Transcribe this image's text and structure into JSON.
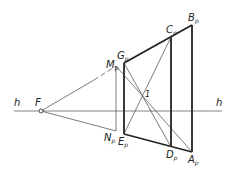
{
  "diagram": {
    "type": "perspective-construction",
    "horizon_label_left": "h",
    "horizon_label_right": "h",
    "vanishing_point": {
      "label": "F",
      "x": 41,
      "y": 111
    },
    "points": {
      "Gp": {
        "main": "G",
        "sub": "p",
        "x": 124,
        "y": 63
      },
      "Ep": {
        "main": "E",
        "sub": "p",
        "x": 124,
        "y": 134
      },
      "Cp": {
        "main": "C",
        "sub": "p",
        "x": 171,
        "y": 37
      },
      "Dp": {
        "main": "D",
        "sub": "p",
        "x": 171,
        "y": 147
      },
      "Bp": {
        "main": "B",
        "sub": "p",
        "x": 192,
        "y": 25
      },
      "Ap": {
        "main": "A",
        "sub": "p",
        "x": 192,
        "y": 152
      },
      "Mp": {
        "main": "M",
        "sub": "p",
        "x": 116,
        "y": 66
      },
      "Np": {
        "main": "N",
        "sub": "p",
        "x": 116,
        "y": 131
      }
    },
    "intersection_label": "1",
    "colors": {
      "line": "#222222",
      "thin": "#444444",
      "horizon": "#555555"
    }
  }
}
